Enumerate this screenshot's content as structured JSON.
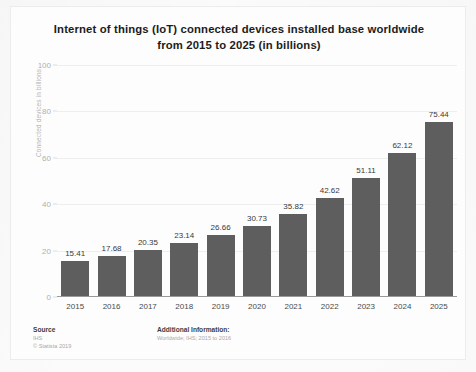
{
  "chart_data": {
    "type": "bar",
    "title": "Internet of things (IoT) connected devices installed base worldwide from 2015 to 2025 (in billions)",
    "title_lines": [
      "Internet of things (IoT) connected devices installed base worldwide",
      "from 2015 to 2025 (in billions)"
    ],
    "categories": [
      "2015",
      "2016",
      "2017",
      "2018",
      "2019",
      "2020",
      "2021",
      "2022",
      "2023",
      "2024",
      "2025"
    ],
    "values": [
      15.41,
      17.68,
      20.35,
      23.14,
      26.66,
      30.73,
      35.82,
      42.62,
      51.11,
      62.12,
      75.44
    ],
    "value_labels": [
      "15.41",
      "17.68",
      "20.35",
      "23.14",
      "26.66",
      "30.73",
      "35.82",
      "42.62",
      "51.11",
      "62.12",
      "75.44"
    ],
    "xlabel": "",
    "ylabel": "Connected devices in billions",
    "ylim": [
      0,
      100
    ],
    "yticks": [
      0,
      20,
      40,
      60,
      80,
      100
    ],
    "ytick_labels": [
      "0",
      "20",
      "40",
      "60",
      "80",
      "100"
    ],
    "grid": true,
    "legend": "none",
    "bar_color": "#5e5e5e",
    "background_color": "#fdfdfd"
  },
  "footer": {
    "source_heading": "Source",
    "source_lines": [
      "IHS",
      "© Statista 2019"
    ],
    "additional_heading": "Additional Information:",
    "additional_lines": [
      "Worldwide; IHS; 2015 to 2016"
    ]
  }
}
